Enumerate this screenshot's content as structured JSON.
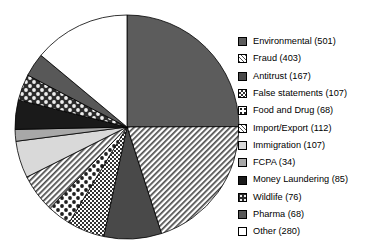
{
  "chart_data": {
    "type": "pie",
    "title": "",
    "total": 2218,
    "start_angle_deg": 0,
    "direction": "clockwise",
    "categories": [
      "Environmental",
      "Fraud",
      "Antitrust",
      "False statements",
      "Food and Drug",
      "Import/Export",
      "Immigration",
      "FCPA",
      "Money Laundering",
      "Wildlife",
      "Pharma",
      "Other"
    ],
    "values": [
      501,
      403,
      167,
      107,
      68,
      112,
      107,
      34,
      85,
      76,
      68,
      280
    ],
    "slices": [
      {
        "label": "Environmental",
        "value": 501,
        "fill": "solid",
        "color": "#5c5c5c",
        "legend_text": "Environmental (501)"
      },
      {
        "label": "Fraud",
        "value": 403,
        "fill": "hatch-fine",
        "color": "#ffffff",
        "legend_text": "Fraud (403)"
      },
      {
        "label": "Antitrust",
        "value": 167,
        "fill": "solid",
        "color": "#494949",
        "legend_text": "Antitrust (167)"
      },
      {
        "label": "False statements",
        "value": 107,
        "fill": "checker",
        "color": "#ffffff",
        "legend_text": "False statements (107)"
      },
      {
        "label": "Food and Drug",
        "value": 68,
        "fill": "dots-dark",
        "color": "#ffffff",
        "legend_text": "Food and Drug (68)"
      },
      {
        "label": "Import/Export",
        "value": 112,
        "fill": "hatch-fine",
        "color": "#ffffff",
        "legend_text": "Import/Export (112)"
      },
      {
        "label": "Immigration",
        "value": 107,
        "fill": "solid",
        "color": "#d9d9d9",
        "legend_text": "Immigration (107)"
      },
      {
        "label": "FCPA",
        "value": 34,
        "fill": "solid",
        "color": "#a8a8a8",
        "legend_text": "FCPA  (34)"
      },
      {
        "label": "Money Laundering",
        "value": 85,
        "fill": "solid",
        "color": "#1a1a1a",
        "legend_text": "Money Laundering (85)"
      },
      {
        "label": "Wildlife",
        "value": 76,
        "fill": "dots-on-dark",
        "color": "#2b2b2b",
        "legend_text": "Wildlife (76)"
      },
      {
        "label": "Pharma",
        "value": 68,
        "fill": "solid",
        "color": "#585858",
        "legend_text": "Pharma (68)"
      },
      {
        "label": "Other",
        "value": 280,
        "fill": "solid",
        "color": "#ffffff",
        "legend_text": "Other (280)"
      }
    ],
    "legend_position": "right",
    "xlabel": "",
    "ylabel": ""
  },
  "geometry": {
    "cx": 127,
    "cy": 127,
    "r": 112
  },
  "colors": {
    "outline": "#000000",
    "background": "#ffffff"
  }
}
